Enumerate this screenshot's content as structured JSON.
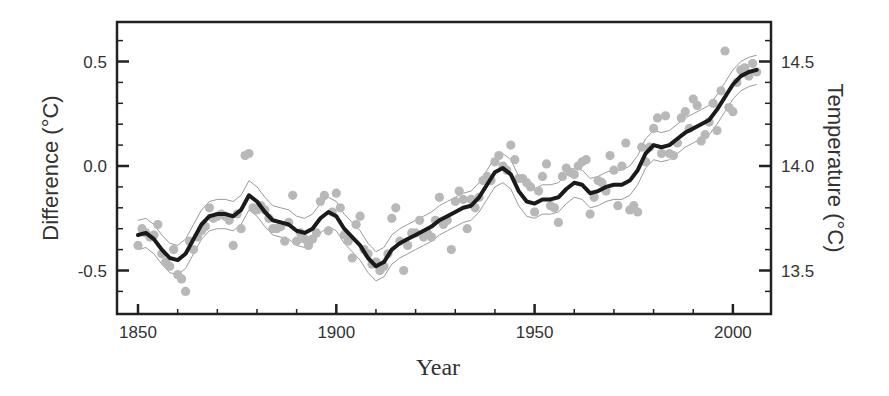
{
  "chart_data": {
    "type": "scatter",
    "title": "",
    "xlabel": "Year",
    "ylabel": "Difference (°C)",
    "ylabel_right": "Temperature (°C)",
    "xlim": [
      1842,
      2010
    ],
    "ylim": [
      -0.71,
      0.69
    ],
    "ylim_right": [
      13.29,
      14.69
    ],
    "x_ticks": [
      1850,
      1900,
      1950,
      2000
    ],
    "x_tick_labels": [
      "1850",
      "1900",
      "1950",
      "2000"
    ],
    "x_minor_step": 10,
    "y_ticks": [
      -0.5,
      0.0,
      0.5
    ],
    "y_tick_labels": [
      "-0.5",
      "0.0",
      "0.5"
    ],
    "y_minor_step": 0.1,
    "y_right_ticks": [
      13.5,
      14.0,
      14.5
    ],
    "y_right_tick_labels": [
      "13.5",
      "14.0",
      "14.5"
    ],
    "grid": false,
    "legend": null,
    "colors": {
      "points": "#b8b8b8",
      "smooth_line": "#1a1a1a",
      "uncertainty_band": "#9a9a9a",
      "axes": "#222222",
      "text": "#333333"
    },
    "series": [
      {
        "name": "Annual values",
        "kind": "scatter",
        "points": [
          [
            1850,
            -0.38
          ],
          [
            1851,
            -0.3
          ],
          [
            1852,
            -0.32
          ],
          [
            1853,
            -0.34
          ],
          [
            1854,
            -0.33
          ],
          [
            1855,
            -0.28
          ],
          [
            1856,
            -0.42
          ],
          [
            1857,
            -0.46
          ],
          [
            1858,
            -0.48
          ],
          [
            1859,
            -0.4
          ],
          [
            1860,
            -0.52
          ],
          [
            1861,
            -0.54
          ],
          [
            1862,
            -0.6
          ],
          [
            1863,
            -0.36
          ],
          [
            1864,
            -0.4
          ],
          [
            1865,
            -0.34
          ],
          [
            1866,
            -0.31
          ],
          [
            1867,
            -0.29
          ],
          [
            1868,
            -0.2
          ],
          [
            1869,
            -0.25
          ],
          [
            1870,
            -0.24
          ],
          [
            1871,
            -0.23
          ],
          [
            1872,
            -0.24
          ],
          [
            1873,
            -0.26
          ],
          [
            1874,
            -0.38
          ],
          [
            1875,
            -0.23
          ],
          [
            1876,
            -0.3
          ],
          [
            1877,
            0.05
          ],
          [
            1878,
            0.06
          ],
          [
            1879,
            -0.2
          ],
          [
            1880,
            -0.21
          ],
          [
            1881,
            -0.19
          ],
          [
            1882,
            -0.21
          ],
          [
            1883,
            -0.25
          ],
          [
            1884,
            -0.3
          ],
          [
            1885,
            -0.3
          ],
          [
            1886,
            -0.29
          ],
          [
            1887,
            -0.36
          ],
          [
            1888,
            -0.27
          ],
          [
            1889,
            -0.14
          ],
          [
            1890,
            -0.36
          ],
          [
            1891,
            -0.32
          ],
          [
            1892,
            -0.35
          ],
          [
            1893,
            -0.38
          ],
          [
            1894,
            -0.35
          ],
          [
            1895,
            -0.32
          ],
          [
            1896,
            -0.17
          ],
          [
            1897,
            -0.14
          ],
          [
            1898,
            -0.31
          ],
          [
            1899,
            -0.22
          ],
          [
            1900,
            -0.13
          ],
          [
            1901,
            -0.2
          ],
          [
            1902,
            -0.33
          ],
          [
            1903,
            -0.36
          ],
          [
            1904,
            -0.44
          ],
          [
            1905,
            -0.28
          ],
          [
            1906,
            -0.24
          ],
          [
            1907,
            -0.4
          ],
          [
            1908,
            -0.42
          ],
          [
            1909,
            -0.47
          ],
          [
            1910,
            -0.46
          ],
          [
            1911,
            -0.5
          ],
          [
            1912,
            -0.48
          ],
          [
            1913,
            -0.42
          ],
          [
            1914,
            -0.25
          ],
          [
            1915,
            -0.2
          ],
          [
            1916,
            -0.36
          ],
          [
            1917,
            -0.5
          ],
          [
            1918,
            -0.38
          ],
          [
            1919,
            -0.32
          ],
          [
            1920,
            -0.32
          ],
          [
            1921,
            -0.26
          ],
          [
            1922,
            -0.34
          ],
          [
            1923,
            -0.32
          ],
          [
            1924,
            -0.34
          ],
          [
            1925,
            -0.26
          ],
          [
            1926,
            -0.15
          ],
          [
            1927,
            -0.28
          ],
          [
            1928,
            -0.26
          ],
          [
            1929,
            -0.4
          ],
          [
            1930,
            -0.17
          ],
          [
            1931,
            -0.12
          ],
          [
            1932,
            -0.16
          ],
          [
            1933,
            -0.3
          ],
          [
            1934,
            -0.16
          ],
          [
            1935,
            -0.2
          ],
          [
            1936,
            -0.15
          ],
          [
            1937,
            -0.07
          ],
          [
            1938,
            -0.05
          ],
          [
            1939,
            -0.07
          ],
          [
            1940,
            0.02
          ],
          [
            1941,
            0.05
          ],
          [
            1942,
            0.0
          ],
          [
            1943,
            -0.02
          ],
          [
            1944,
            0.1
          ],
          [
            1945,
            0.03
          ],
          [
            1946,
            -0.06
          ],
          [
            1947,
            -0.06
          ],
          [
            1948,
            -0.08
          ],
          [
            1949,
            -0.1
          ],
          [
            1950,
            -0.22
          ],
          [
            1951,
            -0.12
          ],
          [
            1952,
            -0.05
          ],
          [
            1953,
            0.01
          ],
          [
            1954,
            -0.19
          ],
          [
            1955,
            -0.2
          ],
          [
            1956,
            -0.27
          ],
          [
            1957,
            -0.05
          ],
          [
            1958,
            -0.01
          ],
          [
            1959,
            -0.03
          ],
          [
            1960,
            -0.04
          ],
          [
            1961,
            0.0
          ],
          [
            1962,
            0.02
          ],
          [
            1963,
            0.03
          ],
          [
            1964,
            -0.23
          ],
          [
            1965,
            -0.15
          ],
          [
            1966,
            -0.07
          ],
          [
            1967,
            -0.08
          ],
          [
            1968,
            -0.12
          ],
          [
            1969,
            0.05
          ],
          [
            1970,
            -0.02
          ],
          [
            1971,
            -0.19
          ],
          [
            1972,
            0.0
          ],
          [
            1973,
            0.11
          ],
          [
            1974,
            -0.21
          ],
          [
            1975,
            -0.19
          ],
          [
            1976,
            -0.22
          ],
          [
            1977,
            0.09
          ],
          [
            1978,
            0.02
          ],
          [
            1979,
            0.09
          ],
          [
            1980,
            0.18
          ],
          [
            1981,
            0.23
          ],
          [
            1982,
            0.06
          ],
          [
            1983,
            0.24
          ],
          [
            1984,
            0.06
          ],
          [
            1985,
            0.05
          ],
          [
            1986,
            0.11
          ],
          [
            1987,
            0.23
          ],
          [
            1988,
            0.26
          ],
          [
            1989,
            0.18
          ],
          [
            1990,
            0.32
          ],
          [
            1991,
            0.29
          ],
          [
            1992,
            0.12
          ],
          [
            1993,
            0.15
          ],
          [
            1994,
            0.21
          ],
          [
            1995,
            0.3
          ],
          [
            1996,
            0.17
          ],
          [
            1997,
            0.36
          ],
          [
            1998,
            0.55
          ],
          [
            1999,
            0.28
          ],
          [
            2000,
            0.26
          ],
          [
            2001,
            0.4
          ],
          [
            2002,
            0.46
          ],
          [
            2003,
            0.47
          ],
          [
            2004,
            0.43
          ],
          [
            2005,
            0.49
          ],
          [
            2006,
            0.45
          ]
        ]
      },
      {
        "name": "Smoothed (decadal)",
        "kind": "line",
        "x": [
          1850,
          1852,
          1854,
          1856,
          1858,
          1860,
          1862,
          1864,
          1866,
          1868,
          1870,
          1872,
          1874,
          1876,
          1878,
          1880,
          1882,
          1884,
          1886,
          1888,
          1890,
          1892,
          1894,
          1896,
          1898,
          1900,
          1902,
          1904,
          1906,
          1908,
          1910,
          1912,
          1914,
          1916,
          1918,
          1920,
          1922,
          1924,
          1926,
          1928,
          1930,
          1932,
          1934,
          1936,
          1938,
          1940,
          1942,
          1944,
          1946,
          1948,
          1950,
          1952,
          1954,
          1956,
          1958,
          1960,
          1962,
          1964,
          1966,
          1968,
          1970,
          1972,
          1974,
          1976,
          1978,
          1980,
          1982,
          1984,
          1986,
          1988,
          1990,
          1992,
          1994,
          1996,
          1998,
          2000,
          2002,
          2004,
          2006
        ],
        "values": [
          -0.33,
          -0.32,
          -0.35,
          -0.4,
          -0.44,
          -0.45,
          -0.42,
          -0.35,
          -0.28,
          -0.24,
          -0.23,
          -0.23,
          -0.24,
          -0.21,
          -0.14,
          -0.17,
          -0.22,
          -0.26,
          -0.27,
          -0.28,
          -0.31,
          -0.32,
          -0.3,
          -0.25,
          -0.22,
          -0.24,
          -0.3,
          -0.34,
          -0.38,
          -0.44,
          -0.48,
          -0.46,
          -0.4,
          -0.37,
          -0.35,
          -0.33,
          -0.31,
          -0.29,
          -0.26,
          -0.24,
          -0.22,
          -0.2,
          -0.19,
          -0.15,
          -0.09,
          -0.03,
          -0.01,
          -0.04,
          -0.12,
          -0.17,
          -0.18,
          -0.16,
          -0.16,
          -0.15,
          -0.11,
          -0.08,
          -0.09,
          -0.13,
          -0.12,
          -0.1,
          -0.09,
          -0.09,
          -0.07,
          -0.02,
          0.06,
          0.1,
          0.09,
          0.1,
          0.13,
          0.16,
          0.18,
          0.2,
          0.22,
          0.27,
          0.33,
          0.39,
          0.43,
          0.45,
          0.46
        ]
      },
      {
        "name": "Uncertainty bounds",
        "kind": "band",
        "half_width": 0.07
      }
    ]
  }
}
